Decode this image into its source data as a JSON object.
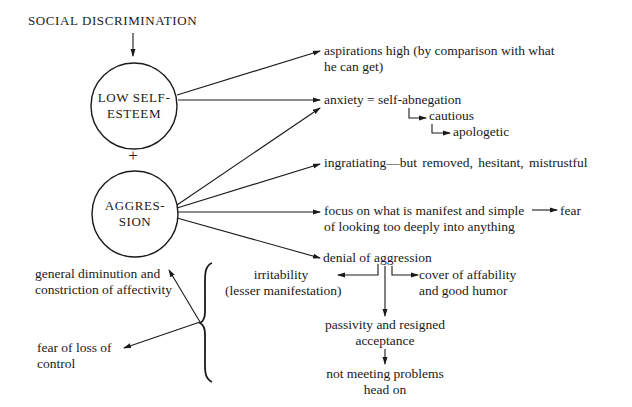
{
  "diagram": {
    "source": {
      "label": "SOCIAL DISCRIMINATION"
    },
    "nodes": {
      "low_self_esteem": {
        "line1": "LOW SELF-",
        "line2": "ESTEEM"
      },
      "plus": "+",
      "aggression": {
        "line1": "AGGRES-",
        "line2": "SION"
      }
    },
    "outcomes": {
      "aspirations": {
        "line1": "aspirations high (by comparison with what",
        "line2": "he can get)"
      },
      "anxiety": {
        "line1": "anxiety = self-abnegation",
        "sub1": "cautious",
        "sub2": "apologetic"
      },
      "ingratiating": {
        "line1": "ingratiating—but removed, hesitant, mistrustful"
      },
      "focus": {
        "line1": "focus on what is manifest and simple",
        "line1_target": "fear",
        "line2": "of looking too deeply into anything"
      },
      "denial": {
        "line1": "denial of aggression",
        "irritability": {
          "line1": "irritability",
          "line2": "(lesser manifestation)"
        },
        "cover": {
          "line1": "cover of affability",
          "line2": "and good humor"
        },
        "passivity": {
          "line1": "passivity and resigned",
          "line2": "acceptance"
        },
        "not_meeting": {
          "line1": "not meeting problems",
          "line2": "head on"
        }
      }
    },
    "brace_outcomes": {
      "diminution": {
        "line1": "general diminution and",
        "line2": "constriction of affectivity"
      },
      "fear_loss": {
        "line1": "fear of loss of",
        "line2": "control"
      }
    },
    "colors": {
      "ink": "#1a1a1a",
      "background": "#ffffff"
    }
  }
}
